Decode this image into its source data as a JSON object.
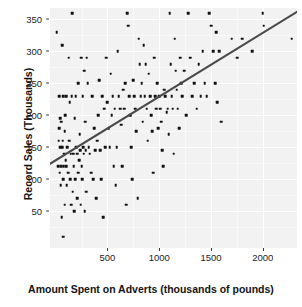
{
  "chart_data": {
    "type": "scatter",
    "title": "",
    "xlabel": "Amount Spent on Adverts (thousands of pounds)",
    "ylabel": "Record Sales (Thousands)",
    "xlim": [
      -55,
      2330
    ],
    "ylim": [
      -8,
      368
    ],
    "xticks": [
      500,
      1000,
      1500,
      2000
    ],
    "yticks": [
      50,
      100,
      150,
      200,
      250,
      300,
      350
    ],
    "grid": true,
    "legend": null,
    "series": [
      {
        "name": "Records",
        "marker": "square",
        "color": "#121212",
        "points": [
          [
            10,
            330
          ],
          [
            26,
            120
          ],
          [
            30,
            160
          ],
          [
            33,
            230
          ],
          [
            36,
            180
          ],
          [
            40,
            110
          ],
          [
            42,
            195
          ],
          [
            45,
            150
          ],
          [
            48,
            90
          ],
          [
            52,
            120
          ],
          [
            55,
            190
          ],
          [
            58,
            40
          ],
          [
            60,
            310
          ],
          [
            62,
            150
          ],
          [
            66,
            160
          ],
          [
            70,
            10
          ],
          [
            72,
            100
          ],
          [
            75,
            230
          ],
          [
            78,
            120
          ],
          [
            80,
            140
          ],
          [
            85,
            60
          ],
          [
            88,
            175
          ],
          [
            92,
            200
          ],
          [
            95,
            130
          ],
          [
            100,
            230
          ],
          [
            104,
            120
          ],
          [
            108,
            90
          ],
          [
            112,
            150
          ],
          [
            118,
            110
          ],
          [
            125,
            290
          ],
          [
            130,
            160
          ],
          [
            135,
            220
          ],
          [
            140,
            100
          ],
          [
            145,
            140
          ],
          [
            150,
            60
          ],
          [
            155,
            230
          ],
          [
            160,
            360
          ],
          [
            165,
            80
          ],
          [
            170,
            140
          ],
          [
            175,
            120
          ],
          [
            180,
            50
          ],
          [
            185,
            195
          ],
          [
            190,
            100
          ],
          [
            195,
            230
          ],
          [
            200,
            150
          ],
          [
            205,
            70
          ],
          [
            210,
            140
          ],
          [
            215,
            110
          ],
          [
            220,
            250
          ],
          [
            225,
            130
          ],
          [
            230,
            170
          ],
          [
            235,
            145
          ],
          [
            240,
            60
          ],
          [
            245,
            290
          ],
          [
            250,
            120
          ],
          [
            255,
            100
          ],
          [
            260,
            230
          ],
          [
            265,
            150
          ],
          [
            270,
            140
          ],
          [
            275,
            270
          ],
          [
            280,
            50
          ],
          [
            285,
            190
          ],
          [
            290,
            145
          ],
          [
            295,
            80
          ],
          [
            300,
            290
          ],
          [
            310,
            250
          ],
          [
            320,
            150
          ],
          [
            330,
            140
          ],
          [
            340,
            110
          ],
          [
            350,
            230
          ],
          [
            360,
            100
          ],
          [
            370,
            180
          ],
          [
            380,
            145
          ],
          [
            390,
            70
          ],
          [
            400,
            160
          ],
          [
            410,
            200
          ],
          [
            420,
            255
          ],
          [
            430,
            145
          ],
          [
            440,
            100
          ],
          [
            450,
            230
          ],
          [
            460,
            40
          ],
          [
            470,
            210
          ],
          [
            480,
            150
          ],
          [
            490,
            290
          ],
          [
            500,
            220
          ],
          [
            510,
            180
          ],
          [
            520,
            150
          ],
          [
            530,
            265
          ],
          [
            540,
            200
          ],
          [
            550,
            230
          ],
          [
            560,
            120
          ],
          [
            570,
            210
          ],
          [
            580,
            90
          ],
          [
            590,
            150
          ],
          [
            600,
            300
          ],
          [
            610,
            230
          ],
          [
            620,
            210
          ],
          [
            630,
            185
          ],
          [
            640,
            120
          ],
          [
            650,
            240
          ],
          [
            660,
            210
          ],
          [
            670,
            250
          ],
          [
            680,
            60
          ],
          [
            690,
            360
          ],
          [
            700,
            340
          ],
          [
            710,
            230
          ],
          [
            720,
            200
          ],
          [
            730,
            150
          ],
          [
            740,
            100
          ],
          [
            750,
            255
          ],
          [
            760,
            230
          ],
          [
            770,
            210
          ],
          [
            780,
            175
          ],
          [
            790,
            70
          ],
          [
            800,
            320
          ],
          [
            810,
            280
          ],
          [
            820,
            230
          ],
          [
            830,
            250
          ],
          [
            840,
            190
          ],
          [
            850,
            310
          ],
          [
            860,
            230
          ],
          [
            870,
            280
          ],
          [
            880,
            210
          ],
          [
            890,
            160
          ],
          [
            900,
            265
          ],
          [
            910,
            230
          ],
          [
            920,
            200
          ],
          [
            930,
            175
          ],
          [
            940,
            110
          ],
          [
            950,
            290
          ],
          [
            960,
            230
          ],
          [
            970,
            210
          ],
          [
            980,
            250
          ],
          [
            990,
            180
          ],
          [
            1000,
            230
          ],
          [
            1010,
            210
          ],
          [
            1020,
            190
          ],
          [
            1030,
            145
          ],
          [
            1040,
            120
          ],
          [
            1050,
            240
          ],
          [
            1060,
            230
          ],
          [
            1070,
            205
          ],
          [
            1080,
            210
          ],
          [
            1090,
            170
          ],
          [
            1100,
            360
          ],
          [
            1110,
            280
          ],
          [
            1120,
            230
          ],
          [
            1130,
            210
          ],
          [
            1140,
            140
          ],
          [
            1150,
            320
          ],
          [
            1160,
            270
          ],
          [
            1170,
            240
          ],
          [
            1180,
            210
          ],
          [
            1190,
            180
          ],
          [
            1200,
            290
          ],
          [
            1210,
            250
          ],
          [
            1220,
            230
          ],
          [
            1240,
            270
          ],
          [
            1260,
            200
          ],
          [
            1280,
            360
          ],
          [
            1300,
            290
          ],
          [
            1320,
            230
          ],
          [
            1340,
            250
          ],
          [
            1360,
            210
          ],
          [
            1380,
            280
          ],
          [
            1400,
            230
          ],
          [
            1420,
            300
          ],
          [
            1440,
            250
          ],
          [
            1460,
            230
          ],
          [
            1480,
            360
          ],
          [
            1500,
            340
          ],
          [
            1520,
            300
          ],
          [
            1540,
            250
          ],
          [
            1550,
            330
          ],
          [
            1560,
            220
          ],
          [
            1580,
            300
          ],
          [
            1600,
            190
          ],
          [
            1700,
            320
          ],
          [
            1750,
            290
          ],
          [
            1800,
            320
          ],
          [
            1900,
            300
          ],
          [
            2000,
            360
          ],
          [
            2010,
            340
          ],
          [
            2280,
            320
          ]
        ]
      }
    ],
    "fit_line": {
      "name": "linear regression",
      "color": "#4a4a4a",
      "width": 2.1,
      "x_start": -55,
      "y_start": 124,
      "x_end": 2330,
      "y_end": 362
    }
  },
  "axes": {
    "x_tick_labels": [
      "500",
      "1000",
      "1500",
      "2000"
    ],
    "y_tick_labels": [
      "50",
      "100",
      "150",
      "200",
      "250",
      "300",
      "350"
    ],
    "x_title": "Amount Spent on Adverts (thousands of pounds)",
    "y_title": "Record Sales (Thousands)"
  },
  "style": {
    "panel_background": "#f2f2f2",
    "grid_color": "#ffffff",
    "point_color": "#121212",
    "line_color": "#4a4a4a",
    "text_color": "#1a1a1a"
  }
}
